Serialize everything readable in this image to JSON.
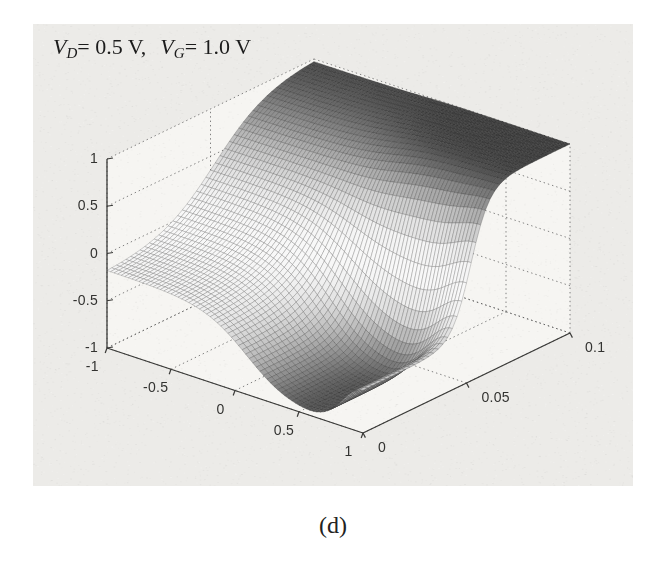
{
  "figure": {
    "caption": "(d)",
    "panel_bg": "#ecebe8",
    "axes_bg": "#f6f5f2",
    "axis_color": "#3a3a38",
    "grid_color": "rgba(90,90,90,0.75)",
    "label_color": "#333331"
  },
  "chart_data": {
    "type": "surface",
    "title_parts": {
      "sym1": "V",
      "sub1": "D",
      "eq1": "= 0.5 V,",
      "sym2": "V",
      "sub2": "G",
      "eq2": "= 1.0 V"
    },
    "xlabel": "",
    "ylabel": "",
    "zlabel": "",
    "legend": "none",
    "grid": "dotted",
    "axes": {
      "x": {
        "min": -1,
        "max": 1,
        "tick_values": [
          -1,
          -0.5,
          0,
          0.5,
          1
        ],
        "tick_labels": [
          "-1",
          "-0.5",
          "0",
          "0.5",
          "1"
        ]
      },
      "y": {
        "min": 0,
        "max": 0.1,
        "tick_values": [
          0,
          0.05,
          0.1
        ],
        "tick_labels": [
          "0",
          "0.05",
          "0.1"
        ]
      },
      "z": {
        "min": -1,
        "max": 1,
        "tick_values": [
          -1,
          -0.5,
          0,
          0.5,
          1
        ],
        "tick_labels": [
          "-1",
          "-0.5",
          "0",
          "0.5",
          "1"
        ]
      }
    },
    "view": {
      "origin": [
        74,
        324
      ],
      "ex": [
        256,
        85
      ],
      "ey": [
        207,
        -100
      ],
      "ez": [
        0,
        -189
      ]
    },
    "mesh": {
      "nx": 72,
      "ny": 44
    },
    "colormap": {
      "light": 248,
      "range": 180,
      "gamma": 2.2,
      "edge_factor": 0.45,
      "edge_alpha": 0.6
    },
    "surface_model": {
      "zback": 1,
      "base": {
        "c0": -0.6,
        "c1": -0.4,
        "k": 3,
        "x0": 0.1,
        "bump": 0.45,
        "bx": 1,
        "bw": 0.22
      },
      "trans": {
        "y0": 0.052,
        "w0": 0.013,
        "w1": 0.0085,
        "k": 5
      }
    },
    "z_samples": {
      "x": [
        -1,
        -0.75,
        -0.5,
        -0.25,
        0,
        0.25,
        0.5,
        0.75,
        1
      ],
      "y": [
        0,
        0.025,
        0.05,
        0.075,
        0.1
      ],
      "z": [
        [
          -0.18,
          -0.07,
          0.35,
          0.83,
          0.97
        ],
        [
          -0.19,
          -0.08,
          0.35,
          0.83,
          0.97
        ],
        [
          -0.2,
          -0.1,
          0.34,
          0.84,
          0.97
        ],
        [
          -0.27,
          -0.18,
          0.3,
          0.86,
          0.98
        ],
        [
          -0.48,
          -0.42,
          0.17,
          0.9,
          0.99
        ],
        [
          -0.77,
          -0.74,
          -0.02,
          0.95,
          0.99
        ],
        [
          -0.93,
          -0.92,
          -0.15,
          0.98,
          1.0
        ],
        [
          -0.86,
          -0.86,
          -0.13,
          0.99,
          1.0
        ],
        [
          -0.55,
          -0.54,
          0.06,
          0.99,
          1.0
        ]
      ]
    }
  }
}
